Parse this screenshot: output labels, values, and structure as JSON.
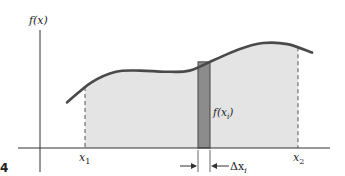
{
  "figure": {
    "number_label": "4",
    "y_axis_label": "f(x)",
    "x1_label": "x",
    "x1_sub": "1",
    "x2_label": "x",
    "x2_sub": "2",
    "strip_height_label": "f(x",
    "strip_height_sub": "i",
    "strip_height_close": ")",
    "strip_width_label": "Δx",
    "strip_width_sub": "i"
  },
  "colors": {
    "curve": "#4a4a4a",
    "area_fill": "#e4e4e4",
    "strip_fill": "#8c8c8c",
    "axis": "#333333"
  },
  "chart_data": {
    "type": "area",
    "xlabel": "",
    "ylabel": "f(x)",
    "curve_description": "smooth curve rising, flattening, then rising to a maximum and dipping slightly",
    "x": [
      0.0,
      0.1,
      0.2,
      0.3,
      0.4,
      0.5,
      0.6,
      0.7,
      0.8,
      0.9,
      1.0
    ],
    "y": [
      0.43,
      0.62,
      0.72,
      0.73,
      0.72,
      0.73,
      0.83,
      0.93,
      0.99,
      0.98,
      0.9
    ],
    "shaded_interval": [
      "x1",
      "x2"
    ],
    "highlighted_strip": {
      "label_height": "f(xi)",
      "label_width": "Δxi"
    }
  }
}
